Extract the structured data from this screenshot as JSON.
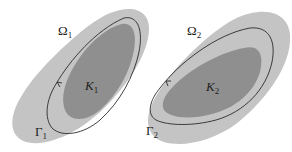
{
  "figure": {
    "colors": {
      "background": "#ffffff",
      "domain_fill": "#c4c4c4",
      "compact_fill": "#8f8f8f",
      "curve_stroke": "#2a2a2a",
      "label_color": "#222222"
    },
    "panels": [
      {
        "domain_label": {
          "symbol": "Ω",
          "subscript": "1"
        },
        "compact_label": {
          "symbol": "K",
          "subscript": "1"
        },
        "curve_label": {
          "symbol": "Γ",
          "subscript": "1"
        },
        "curve_arrow": "orientation-arrow"
      },
      {
        "domain_label": {
          "symbol": "Ω",
          "subscript": "2"
        },
        "compact_label": {
          "symbol": "K",
          "subscript": "2"
        },
        "curve_label": {
          "symbol": "Γ",
          "subscript": "2"
        },
        "curve_arrow": "orientation-arrow"
      }
    ]
  }
}
